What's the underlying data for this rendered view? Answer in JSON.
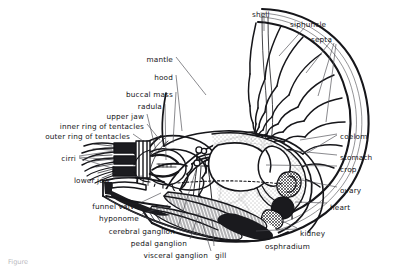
{
  "figure": {
    "caption": "Figure",
    "background_color": "#ffffff",
    "ink_color": "#16161a"
  },
  "labels": [
    {
      "id": "shell",
      "text": "shell",
      "x": 252,
      "y": 11,
      "align": "left"
    },
    {
      "id": "siphuncle",
      "text": "siphuncle",
      "x": 290,
      "y": 21,
      "align": "left"
    },
    {
      "id": "septa",
      "text": "septa",
      "x": 311,
      "y": 36,
      "align": "left"
    },
    {
      "id": "mantle",
      "text": "mantle",
      "x": 173,
      "y": 56,
      "align": "right"
    },
    {
      "id": "hood",
      "text": "hood",
      "x": 173,
      "y": 74,
      "align": "right"
    },
    {
      "id": "buccal-mass",
      "text": "buccal mass",
      "x": 173,
      "y": 91,
      "align": "right"
    },
    {
      "id": "radula",
      "text": "radula",
      "x": 162,
      "y": 103,
      "align": "right"
    },
    {
      "id": "upper-jaw",
      "text": "upper jaw",
      "x": 144,
      "y": 113,
      "align": "right"
    },
    {
      "id": "inner-ring-of-tentacles",
      "text": "inner ring of tentacles",
      "x": 144,
      "y": 123,
      "align": "right"
    },
    {
      "id": "outer-ring-of-tentacles",
      "text": "outer ring of tentacles",
      "x": 130,
      "y": 133,
      "align": "right"
    },
    {
      "id": "cirri",
      "text": "cirri",
      "x": 76,
      "y": 155,
      "align": "right"
    },
    {
      "id": "lower-jaw",
      "text": "lower jaw",
      "x": 110,
      "y": 177,
      "align": "right"
    },
    {
      "id": "funnel-valve",
      "text": "funnel valve",
      "x": 139,
      "y": 203,
      "align": "right"
    },
    {
      "id": "hyponome",
      "text": "hyponome",
      "x": 139,
      "y": 215,
      "align": "right"
    },
    {
      "id": "cerebral-ganglion",
      "text": "cerebral ganglion",
      "x": 175,
      "y": 228,
      "align": "right"
    },
    {
      "id": "pedal-ganglion",
      "text": "pedal ganglion",
      "x": 187,
      "y": 240,
      "align": "right"
    },
    {
      "id": "visceral-ganglion",
      "text": "visceral ganglion",
      "x": 208,
      "y": 252,
      "align": "right"
    },
    {
      "id": "gill",
      "text": "gill",
      "x": 215,
      "y": 252,
      "align": "left"
    },
    {
      "id": "coelom",
      "text": "coelom",
      "x": 340,
      "y": 133,
      "align": "left"
    },
    {
      "id": "stomach",
      "text": "stomach",
      "x": 340,
      "y": 154,
      "align": "left"
    },
    {
      "id": "crop",
      "text": "crop",
      "x": 340,
      "y": 166,
      "align": "left"
    },
    {
      "id": "ovary",
      "text": "ovary",
      "x": 340,
      "y": 187,
      "align": "left"
    },
    {
      "id": "heart",
      "text": "heart",
      "x": 330,
      "y": 204,
      "align": "left"
    },
    {
      "id": "kidney",
      "text": "kidney",
      "x": 300,
      "y": 230,
      "align": "left"
    },
    {
      "id": "osphradium",
      "text": "osphradium",
      "x": 265,
      "y": 243,
      "align": "left"
    }
  ]
}
